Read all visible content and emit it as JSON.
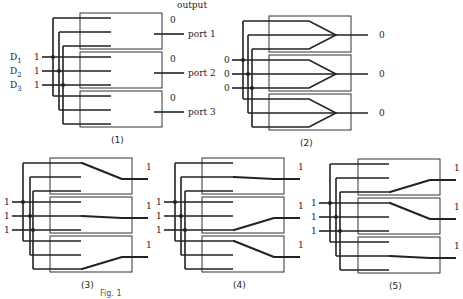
{
  "figure": {
    "output_header": "output",
    "caption_fragment": "Fig. 1",
    "inputs": [
      "D1",
      "D2",
      "D3"
    ],
    "ports": [
      "port 1",
      "port 2",
      "port 3"
    ]
  },
  "panels": [
    {
      "id": "1",
      "label": "(1)",
      "origin": [
        80,
        13
      ],
      "bus_x": [
        53,
        59,
        63
      ],
      "input_start_x": 42,
      "input_values": [
        "1",
        "1",
        "1"
      ],
      "output_values": [
        "0",
        "0",
        "0"
      ],
      "mode": "open",
      "routes": []
    },
    {
      "id": "2",
      "label": "(2)",
      "origin": [
        269,
        16
      ],
      "bus_x": [
        243,
        248,
        252
      ],
      "input_start_x": 232,
      "input_values": [
        "0",
        "0",
        "0"
      ],
      "output_values": [
        "0",
        "0",
        "0"
      ],
      "mode": "merge",
      "routes": []
    },
    {
      "id": "3",
      "label": "(3)",
      "origin": [
        50,
        158
      ],
      "bus_x": [
        23,
        30,
        33
      ],
      "input_start_x": 12,
      "input_values": [
        "1",
        "1",
        "1"
      ],
      "output_values": [
        "1",
        "1",
        "1"
      ],
      "mode": "route",
      "routes": [
        0,
        1,
        2
      ]
    },
    {
      "id": "4",
      "label": "(4)",
      "origin": [
        202,
        158
      ],
      "bus_x": [
        175,
        181,
        185
      ],
      "input_start_x": 164,
      "input_values": [
        "1",
        "1",
        "1"
      ],
      "output_values": [
        "1",
        "1",
        "1"
      ],
      "mode": "route",
      "routes": [
        1,
        2,
        0
      ]
    },
    {
      "id": "5",
      "label": "(5)",
      "origin": [
        358,
        159
      ],
      "bus_x": [
        330,
        336,
        340
      ],
      "input_start_x": 319,
      "input_values": [
        "1",
        "1",
        "1"
      ],
      "output_values": [
        "1",
        "1",
        "1"
      ],
      "mode": "route",
      "routes": [
        2,
        0,
        1
      ]
    }
  ],
  "colors": {
    "line": "#222222",
    "box": "#333333",
    "background": "#ffffff"
  }
}
